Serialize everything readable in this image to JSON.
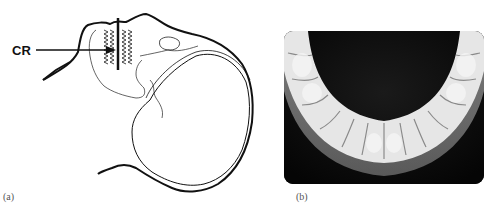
{
  "figure": {
    "panels": [
      {
        "id": "a",
        "caption": "(a)",
        "type": "line-drawing",
        "subject": "lateral skull outline with dental arch and central ray",
        "labels": [
          {
            "text": "CR",
            "meaning": "central ray arrow pointing at teeth"
          }
        ]
      },
      {
        "id": "b",
        "caption": "(b)",
        "type": "radiograph",
        "subject": "mandibular occlusal x-ray showing lower dental arch"
      }
    ],
    "colors": {
      "line": "#111111",
      "background": "#ffffff",
      "xray_dark": "#0a0a0a",
      "xray_bright": "#e8e8e8"
    }
  }
}
